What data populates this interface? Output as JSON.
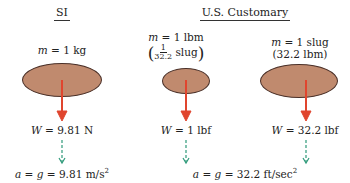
{
  "headers": {
    "si": "SI",
    "us": "U.S. Customary"
  },
  "si": {
    "mass_var": "m",
    "mass_val": "= 1 kg",
    "weight_var": "W",
    "weight_val": "= 9.81 N",
    "accel_a": "a",
    "accel_g": "g",
    "accel_val": "= 9.81 m/s",
    "accel_exp": "2"
  },
  "us_lbm": {
    "mass_var": "m",
    "mass_val": "= 1 lbm",
    "frac_num": "1",
    "frac_den": "32.2",
    "frac_unit": "slug",
    "weight_var": "W",
    "weight_val": "= 1 lbf"
  },
  "us_slug": {
    "mass_var": "m",
    "mass_val": "= 1 slug",
    "mass_alt": "(32.2 lbm)",
    "weight_var": "W",
    "weight_val": "= 32.2 lbf"
  },
  "us_accel": {
    "accel_a": "a",
    "accel_g": "g",
    "accel_val": "= 32.2 ft/sec",
    "accel_exp": "2"
  },
  "colors": {
    "mass_fill": "#c08a6e",
    "mass_stroke": "#4a3028",
    "weight_arrow": "#e0452e",
    "accel_arrow": "#2f9a7a"
  }
}
